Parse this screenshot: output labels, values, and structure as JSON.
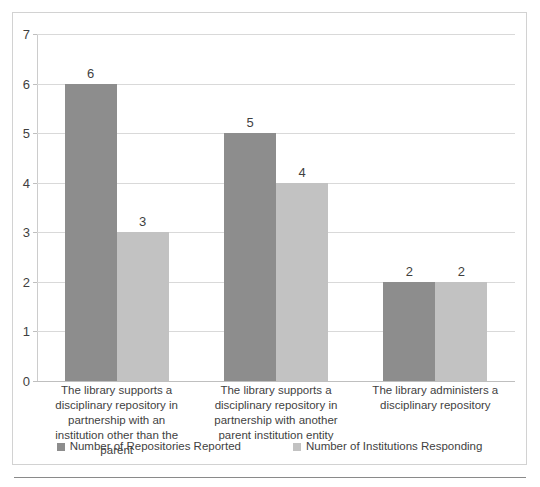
{
  "chart_data": {
    "type": "bar",
    "title": "",
    "subtitle": "",
    "xlabel": "",
    "ylabel": "",
    "ylim": [
      0,
      7
    ],
    "y_ticks": [
      0,
      1,
      2,
      3,
      4,
      5,
      6,
      7
    ],
    "grid": true,
    "legend_position": "bottom",
    "show_data_labels": true,
    "categories": [
      "The library supports a disciplinary repository in partnership with an institution other than the parent",
      "The library supports a disciplinary repository in partnership with another parent institution entity",
      "The library administers a disciplinary repository"
    ],
    "series": [
      {
        "name": "Number of Repositories Reported",
        "color": "#8d8d8d",
        "values": [
          6,
          5,
          2
        ]
      },
      {
        "name": "Number of Institutions Responding",
        "color": "#c2c2c2",
        "values": [
          3,
          4,
          2
        ]
      }
    ]
  }
}
